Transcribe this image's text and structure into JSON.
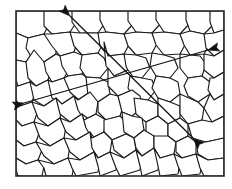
{
  "figure": {
    "caption": "",
    "background_color": "#ffffff",
    "frame": {
      "x": 16,
      "y": 11,
      "width": 208,
      "height": 165,
      "stroke_color": "#2b2b2b",
      "stroke_width": 1.6
    },
    "grain_boundary_color": "#1a1a1a",
    "grain_fill_color": "#ffffff",
    "grain_count": 78
  },
  "measurement_lines": [
    {
      "name": "shallow-intercept-line",
      "label": "",
      "x1": 24,
      "y1": 103,
      "x2": 208,
      "y2": 50,
      "color": "#111111",
      "double_headed": true,
      "start_arrow_direction": "down-left",
      "end_arrow_direction": "up-right"
    },
    {
      "name": "steep-intercept-line",
      "label": "",
      "x1": 70,
      "y1": 16,
      "x2": 193,
      "y2": 138,
      "color": "#111111",
      "double_headed": true,
      "start_arrow_direction": "up-left",
      "end_arrow_direction": "down-right"
    }
  ],
  "annotations": {
    "crossing_point": {
      "x": 118,
      "y": 72
    },
    "arrowheads": [
      {
        "name": "arrowhead-top-left",
        "x": 70,
        "y": 16,
        "points": "up-left"
      },
      {
        "name": "arrowhead-right",
        "x": 208,
        "y": 50,
        "points": "up-right"
      },
      {
        "name": "arrowhead-left",
        "x": 24,
        "y": 103,
        "points": "down-left"
      },
      {
        "name": "arrowhead-bottom-right",
        "x": 193,
        "y": 138,
        "points": "down-right"
      }
    ]
  },
  "grains": [
    "M16,11 L44,11 L50,22 L44,34 L28,38 L16,33 Z",
    "M44,11 L72,11 L78,20 L70,32 L52,34 L44,26 Z",
    "M72,11 L100,11 L106,21 L98,33 L80,33 L72,22 Z",
    "M100,11 L128,11 L134,23 L124,34 L106,32 L100,20 Z",
    "M128,11 L156,11 L162,22 L152,33 L136,32 L128,21 Z",
    "M156,11 L186,11 L190,23 L180,34 L164,32 L156,20 Z",
    "M186,11 L210,11 L214,24 L204,34 L190,31 L186,20 Z",
    "M210,11 L224,11 L224,30 L214,33 L210,22 Z",
    "M16,33 L28,38 L34,50 L26,62 L16,60 Z",
    "M28,38 L44,34 L56,40 L56,54 L44,62 L32,58 L26,48 Z",
    "M44,34 L52,34 L70,32 L78,40 L74,52 L60,56 L52,46 Z",
    "M70,32 L80,33 L98,33 L104,42 L98,53 L82,55 L74,46 Z",
    "M98,33 L106,32 L124,34 L130,43 L124,54 L108,56 L100,46 Z",
    "M124,34 L136,32 L152,33 L158,42 L152,53 L136,55 L128,46 Z",
    "M152,33 L164,32 L180,34 L186,43 L180,54 L164,55 L156,45 Z",
    "M180,34 L190,31 L204,34 L210,44 L204,54 L190,55 L184,45 Z",
    "M204,34 L214,33 L224,30 L224,50 L214,56 L206,48 Z",
    "M16,60 L26,62 L34,70 L30,82 L18,86 L16,80 Z",
    "M26,62 L34,50 L44,62 L52,68 L48,80 L36,86 L28,78 Z",
    "M44,62 L56,54 L64,58 L70,68 L64,78 L52,82 L46,72 Z",
    "M60,56 L74,52 L82,55 L88,64 L82,74 L68,76 L62,66 Z",
    "M82,55 L98,53 L104,58 L108,68 L100,78 L86,77 L80,68 Z",
    "M104,42 L108,56 L124,54 L130,60 L128,70 L114,76 L106,66 Z",
    "M124,54 L136,55 L146,58 L150,68 L142,78 L130,76 L126,66 Z",
    "M152,53 L164,55 L174,58 L178,68 L170,78 L156,76 L150,66 Z",
    "M180,54 L190,55 L200,56 L206,64 L202,76 L188,78 L180,68 Z",
    "M204,54 L214,56 L224,50 L224,72 L214,78 L204,70 Z",
    "M16,86 L18,86 L30,82 L36,90 L32,102 L20,106 L16,100 Z",
    "M30,82 L36,86 L48,80 L56,86 L56,98 L44,106 L34,100 Z",
    "M48,80 L52,82 L64,78 L72,84 L74,96 L62,104 L52,98 Z",
    "M64,78 L68,76 L82,74 L90,80 L90,92 L78,100 L70,92 Z",
    "M86,77 L100,78 L108,82 L110,94 L98,102 L88,96 Z",
    "M108,68 L114,76 L128,70 L134,78 L132,90 L118,96 L108,86 Z",
    "M130,76 L142,78 L152,80 L156,90 L148,100 L134,98 L128,88 Z",
    "M156,76 L170,78 L178,82 L180,94 L170,102 L158,98 L152,88 Z",
    "M188,78 L202,76 L210,82 L210,94 L198,102 L188,96 L184,86 Z",
    "M210,78 L214,78 L224,72 L224,94 L214,100 L208,90 Z",
    "M16,100 L20,106 L32,102 L38,110 L34,122 L22,126 L16,120 Z",
    "M32,102 L44,106 L56,98 L62,106 L60,118 L48,126 L38,118 Z",
    "M56,98 L62,104 L74,96 L82,102 L82,114 L70,122 L60,114 Z",
    "M74,96 L78,100 L90,92 L98,102 L96,114 L84,120 L78,110 Z",
    "M98,102 L110,94 L118,96 L124,104 L120,116 L106,120 L98,112 Z",
    "M118,96 L132,90 L140,96 L142,108 L132,116 L122,112 Z",
    "M134,98 L148,100 L158,104 L158,116 L146,122 L136,114 Z",
    "M158,98 L170,102 L180,106 L180,118 L168,124 L158,116 Z",
    "M180,94 L198,102 L204,108 L202,120 L188,124 L180,114 Z",
    "M204,108 L210,94 L214,100 L224,94 L224,116 L212,122 Z",
    "M16,120 L22,126 L34,122 L40,130 L36,142 L24,146 L16,140 Z",
    "M34,122 L48,126 L60,118 L66,126 L64,138 L50,146 L40,138 Z",
    "M60,118 L70,122 L82,114 L90,120 L90,132 L76,140 L66,132 Z",
    "M82,114 L84,120 L96,114 L106,120 L104,132 L92,138 L86,128 Z",
    "M104,120 L120,116 L126,122 L126,134 L112,140 L104,132 Z",
    "M122,112 L132,116 L142,118 L144,130 L134,138 L124,132 Z",
    "M146,122 L158,116 L168,124 L168,136 L156,142 L146,134 Z",
    "M168,124 L180,118 L188,124 L188,136 L176,142 L168,136 Z",
    "M188,124 L202,120 L212,122 L224,116 L224,138 L206,142 L192,138 Z",
    "M16,140 L24,146 L36,142 L42,150 L38,160 L26,164 L16,158 Z",
    "M36,142 L50,146 L64,138 L70,146 L68,158 L54,164 L44,156 Z",
    "M64,138 L76,140 L90,132 L96,140 L94,152 L80,160 L70,152 Z",
    "M90,132 L92,138 L104,132 L112,140 L110,152 L98,158 L92,148 Z",
    "M112,140 L126,134 L134,138 L136,150 L124,158 L114,150 Z",
    "M134,138 L144,130 L154,136 L154,148 L142,156 L136,148 Z",
    "M154,136 L168,136 L176,142 L174,154 L160,158 L154,148 Z",
    "M176,142 L188,136 L196,142 L196,154 L182,158 L176,152 Z",
    "M196,142 L206,142 L224,138 L224,158 L208,160 L198,154 Z",
    "M16,158 L26,164 L38,160 L44,166 L42,176 L18,176 L16,170 Z",
    "M38,160 L54,164 L68,158 L74,166 L72,176 L46,176 L44,168 Z",
    "M68,158 L80,160 L94,152 L100,160 L98,172 L76,176 L72,168 Z",
    "M94,152 L98,158 L110,152 L118,158 L116,170 L100,176 L98,166 Z",
    "M110,152 L124,158 L136,150 L142,158 L140,170 L120,176 L116,168 Z",
    "M136,150 L142,156 L154,148 L160,158 L158,170 L142,176 L140,166 Z",
    "M154,148 L160,158 L174,154 L180,162 L178,174 L160,176 L158,166 Z",
    "M174,154 L182,158 L196,154 L202,162 L200,174 L182,176 L178,166 Z",
    "M196,154 L208,160 L224,158 L224,176 L204,176 L200,168 Z",
    "M16,176 L18,176 L20,176 L16,176 Z"
  ]
}
